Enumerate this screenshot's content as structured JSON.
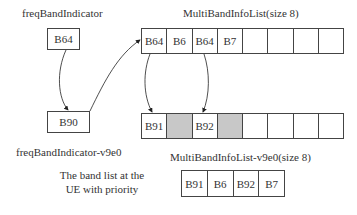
{
  "labels": {
    "freq_band_indicator": "freqBandIndicator",
    "freq_band_indicator_v9e0": "freqBandIndicator-v9e0",
    "multi_band_info_list": "MultiBandInfoList(size 8)",
    "multi_band_info_list_v9e0": "MultiBandInfoList-v9e0(size 8)",
    "priority_caption_line1": "The band list at the",
    "priority_caption_line2": "UE with priority"
  },
  "freq_band_indicator_box": {
    "value": "B64"
  },
  "freq_band_indicator_v9e0_box": {
    "value": "B90"
  },
  "multi_band_info_list": {
    "cells": [
      {
        "value": "B64",
        "shaded": false
      },
      {
        "value": "B6",
        "shaded": false
      },
      {
        "value": "B64",
        "shaded": false
      },
      {
        "value": "B7",
        "shaded": false
      },
      {
        "value": "",
        "shaded": false
      },
      {
        "value": "",
        "shaded": false
      },
      {
        "value": "",
        "shaded": false
      },
      {
        "value": "",
        "shaded": false
      }
    ]
  },
  "multi_band_info_list_v9e0": {
    "cells": [
      {
        "value": "B91",
        "shaded": false
      },
      {
        "value": "",
        "shaded": true
      },
      {
        "value": "B92",
        "shaded": false
      },
      {
        "value": "",
        "shaded": true
      },
      {
        "value": "",
        "shaded": false
      },
      {
        "value": "",
        "shaded": false
      },
      {
        "value": "",
        "shaded": false
      },
      {
        "value": "",
        "shaded": false
      }
    ]
  },
  "priority_list": {
    "cells": [
      {
        "value": "B91"
      },
      {
        "value": "B6"
      },
      {
        "value": "B92"
      },
      {
        "value": "B7"
      }
    ]
  },
  "colors": {
    "line": "#444444",
    "shade": "#c8c8c8",
    "text": "#333333"
  }
}
